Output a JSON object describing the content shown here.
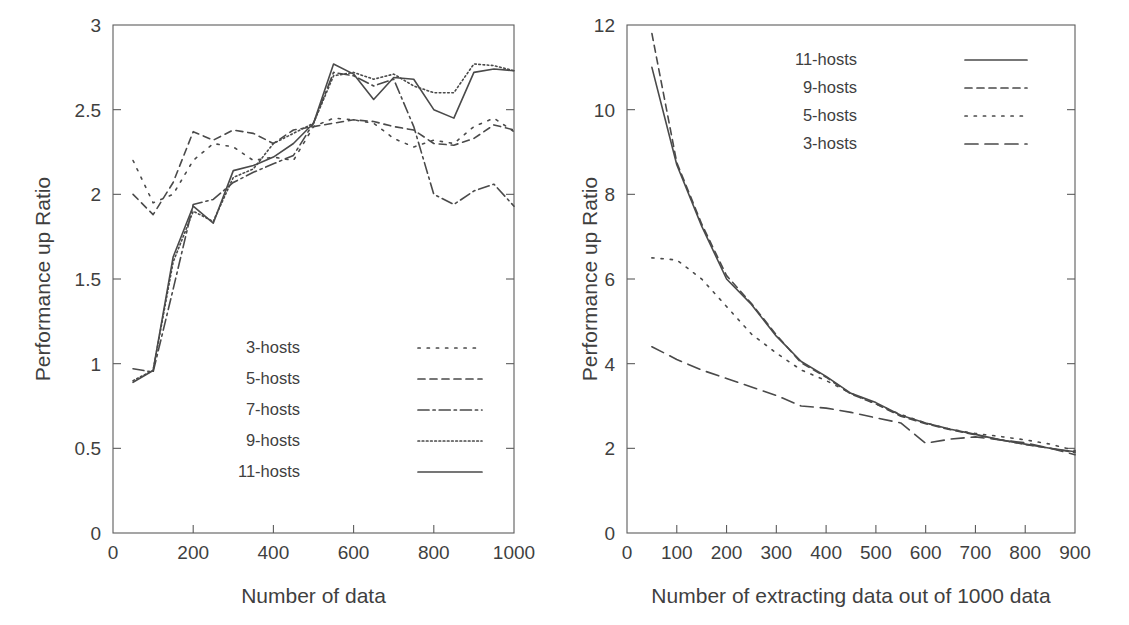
{
  "figure": {
    "panels": [
      "left",
      "right"
    ],
    "line_color": "#4a4a4a",
    "axis_color": "#5c5c5c",
    "background": "#ffffff"
  },
  "chart_data": [
    {
      "id": "left",
      "type": "line",
      "title": "",
      "xlabel": "Number of data",
      "ylabel": "Performance up Ratio",
      "xlim": [
        0,
        1000
      ],
      "ylim": [
        0,
        3
      ],
      "xticks": [
        0,
        200,
        400,
        600,
        800,
        1000
      ],
      "xticklabels": [
        "0",
        "200",
        "400",
        "600",
        "800",
        "1000"
      ],
      "yticks": [
        0,
        0.5,
        1,
        1.5,
        2,
        2.5,
        3
      ],
      "yticklabels": [
        "0",
        "0.5",
        "1",
        "1.5",
        "2",
        "2.5",
        "3"
      ],
      "grid": false,
      "legend_position": "lower-right",
      "x": [
        50,
        100,
        150,
        200,
        250,
        300,
        350,
        400,
        450,
        500,
        550,
        600,
        650,
        700,
        750,
        800,
        850,
        900,
        950,
        1000
      ],
      "series": [
        {
          "name": "3-hosts",
          "dash": "dotted",
          "values": [
            2.2,
            1.95,
            2.0,
            2.2,
            2.3,
            2.28,
            2.2,
            2.22,
            2.2,
            2.4,
            2.45,
            2.44,
            2.42,
            2.33,
            2.28,
            2.32,
            2.3,
            2.4,
            2.45,
            2.37
          ]
        },
        {
          "name": "5-hosts",
          "dash": "dashed",
          "values": [
            2.0,
            1.88,
            2.07,
            2.37,
            2.32,
            2.38,
            2.36,
            2.3,
            2.38,
            2.4,
            2.42,
            2.44,
            2.43,
            2.4,
            2.38,
            2.3,
            2.29,
            2.33,
            2.41,
            2.38
          ]
        },
        {
          "name": "7-hosts",
          "dash": "dashdot",
          "values": [
            0.97,
            0.95,
            1.44,
            1.94,
            1.97,
            2.07,
            2.13,
            2.18,
            2.23,
            2.42,
            2.72,
            2.7,
            2.64,
            2.68,
            2.4,
            2.0,
            1.94,
            2.02,
            2.06,
            1.93
          ]
        },
        {
          "name": "9-hosts",
          "dash": "finedotted",
          "values": [
            0.9,
            0.96,
            1.6,
            1.9,
            1.84,
            2.1,
            2.15,
            2.3,
            2.36,
            2.42,
            2.7,
            2.72,
            2.68,
            2.71,
            2.64,
            2.6,
            2.6,
            2.77,
            2.76,
            2.73
          ]
        },
        {
          "name": "11-hosts",
          "dash": "solid",
          "values": [
            0.89,
            0.96,
            1.63,
            1.93,
            1.83,
            2.14,
            2.17,
            2.22,
            2.3,
            2.42,
            2.77,
            2.71,
            2.56,
            2.69,
            2.68,
            2.5,
            2.45,
            2.72,
            2.74,
            2.73
          ]
        }
      ]
    },
    {
      "id": "right",
      "type": "line",
      "title": "",
      "xlabel": "Number of extracting data out of 1000 data",
      "ylabel": "Performance up Ratio",
      "xlim": [
        0,
        900
      ],
      "ylim": [
        0,
        12
      ],
      "xticks": [
        0,
        100,
        200,
        300,
        400,
        500,
        600,
        700,
        800,
        900
      ],
      "xticklabels": [
        "0",
        "100",
        "200",
        "300",
        "400",
        "500",
        "600",
        "700",
        "800",
        "900"
      ],
      "yticks": [
        0,
        2,
        4,
        6,
        8,
        10,
        12
      ],
      "yticklabels": [
        "0",
        "2",
        "4",
        "6",
        "8",
        "10",
        "12"
      ],
      "grid": false,
      "legend_position": "upper-right",
      "x": [
        50,
        100,
        150,
        200,
        250,
        300,
        350,
        400,
        450,
        500,
        550,
        600,
        650,
        700,
        750,
        800,
        850,
        900
      ],
      "series": [
        {
          "name": "11-hosts",
          "dash": "solid",
          "values": [
            11.0,
            8.7,
            7.25,
            6.0,
            5.4,
            4.65,
            4.05,
            3.7,
            3.3,
            3.08,
            2.78,
            2.6,
            2.45,
            2.33,
            2.2,
            2.1,
            2.0,
            1.92
          ]
        },
        {
          "name": "9-hosts",
          "dash": "dashed",
          "values": [
            11.8,
            8.75,
            7.3,
            6.08,
            5.42,
            4.68,
            4.02,
            3.68,
            3.28,
            3.05,
            2.76,
            2.58,
            2.44,
            2.32,
            2.2,
            2.09,
            2.0,
            1.9
          ]
        },
        {
          "name": "5-hosts",
          "dash": "dotted",
          "values": [
            6.5,
            6.45,
            6.0,
            5.35,
            4.7,
            4.25,
            3.85,
            3.6,
            3.3,
            3.05,
            2.8,
            2.6,
            2.45,
            2.35,
            2.28,
            2.2,
            2.1,
            1.95
          ]
        },
        {
          "name": "3-hosts",
          "dash": "longdash",
          "values": [
            4.4,
            4.1,
            3.85,
            3.65,
            3.45,
            3.25,
            3.0,
            2.95,
            2.85,
            2.72,
            2.6,
            2.12,
            2.22,
            2.27,
            2.2,
            2.13,
            2.0,
            1.85
          ]
        }
      ]
    }
  ]
}
